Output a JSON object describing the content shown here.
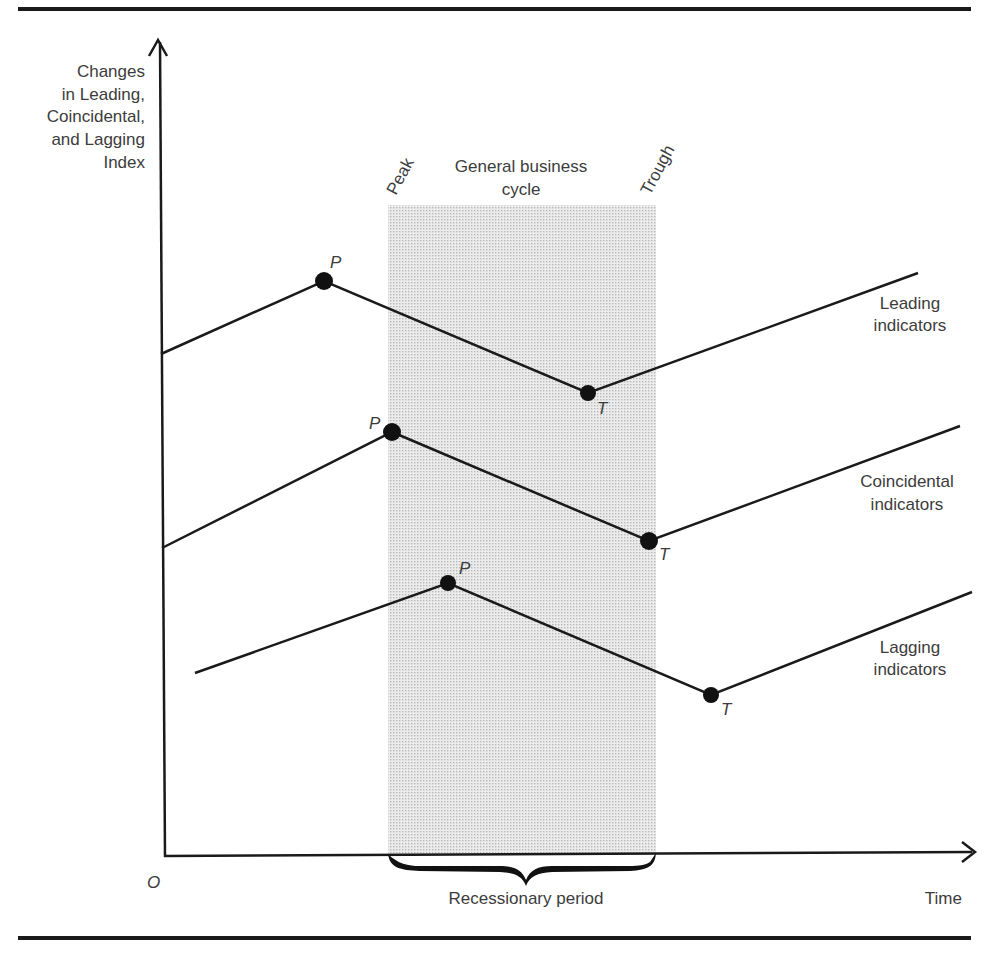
{
  "figure": {
    "y_axis_label": [
      "Changes",
      "in Leading,",
      "Coincidental,",
      "and Lagging",
      "Index"
    ],
    "x_axis_label": "Time",
    "origin_label": "O",
    "shaded_region": {
      "title_line1": "General business",
      "title_line2": "cycle",
      "left_label": "Peak",
      "right_label": "Trough",
      "bracket_label": "Recessionary period"
    },
    "series": [
      {
        "name_line1": "Leading",
        "name_line2": "indicators",
        "peak_label": "P",
        "trough_label": "T"
      },
      {
        "name_line1": "Coincidental",
        "name_line2": "indicators",
        "peak_label": "P",
        "trough_label": "T"
      },
      {
        "name_line1": "Lagging",
        "name_line2": "indicators",
        "peak_label": "P",
        "trough_label": "T"
      }
    ],
    "colors": {
      "line": "#1a1a1a",
      "shade": "#d9d9d9",
      "text": "#3c3c3c"
    }
  }
}
